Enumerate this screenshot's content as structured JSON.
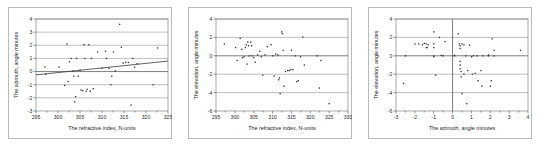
{
  "figure": {
    "panel_count": 3,
    "background_color": "#ffffff",
    "frame_color": "#b9b9b9",
    "marker_color": "#2b2b2b",
    "gridline_color": "#8a8a8a",
    "trendline_color": "#3a3a3a"
  },
  "chart_data": [
    {
      "type": "scatter",
      "title": "",
      "xlabel": "The refractive index, N-units",
      "ylabel": "The azimuth, angle minutes",
      "xlim": [
        295,
        325
      ],
      "ylim": [
        -3,
        4
      ],
      "xticks": [
        295,
        300,
        305,
        310,
        315,
        320,
        325
      ],
      "xtick_labels": [
        "295",
        "300",
        "305",
        "310",
        "315",
        "320",
        "325"
      ],
      "yticks": [
        -3,
        -2,
        -1,
        0,
        1,
        2,
        3,
        4
      ],
      "ytick_labels": [
        "-3",
        "-2",
        "-1",
        "0",
        "1",
        "2",
        "3",
        "4"
      ],
      "grid": true,
      "legend": null,
      "trendline": {
        "x0": 295,
        "y0": -0.25,
        "x1": 325,
        "y1": 0.8
      },
      "points": [
        [
          297.0,
          0.35
        ],
        [
          297.2,
          -0.2
        ],
        [
          300.2,
          0.35
        ],
        [
          301.5,
          -1.05
        ],
        [
          302.0,
          2.1
        ],
        [
          302.3,
          -0.75
        ],
        [
          302.6,
          0.75
        ],
        [
          303.0,
          1.0
        ],
        [
          303.4,
          0.05
        ],
        [
          303.6,
          -0.35
        ],
        [
          303.8,
          -2.3
        ],
        [
          304.0,
          -1.9
        ],
        [
          304.2,
          1.0
        ],
        [
          304.6,
          -0.35
        ],
        [
          305.0,
          0.1
        ],
        [
          305.2,
          -1.4
        ],
        [
          305.6,
          -1.45
        ],
        [
          305.9,
          2.05
        ],
        [
          306.1,
          1.0
        ],
        [
          306.4,
          -1.5
        ],
        [
          306.6,
          -1.35
        ],
        [
          307.0,
          2.05
        ],
        [
          307.3,
          -1.5
        ],
        [
          307.6,
          1.0
        ],
        [
          308.0,
          -1.3
        ],
        [
          309.0,
          1.5
        ],
        [
          310.0,
          0.25
        ],
        [
          310.8,
          1.55
        ],
        [
          311.0,
          1.0
        ],
        [
          311.6,
          0.25
        ],
        [
          312.0,
          -1.0
        ],
        [
          312.2,
          -0.35
        ],
        [
          312.6,
          1.5
        ],
        [
          313.0,
          0.05
        ],
        [
          314.0,
          3.6
        ],
        [
          314.4,
          1.85
        ],
        [
          314.8,
          0.65
        ],
        [
          315.4,
          0.7
        ],
        [
          316.0,
          0.7
        ],
        [
          316.6,
          -2.55
        ],
        [
          317.0,
          1.0
        ],
        [
          317.4,
          0.35
        ],
        [
          318.0,
          0.6
        ],
        [
          321.6,
          -1.0
        ],
        [
          322.6,
          1.8
        ]
      ]
    },
    {
      "type": "scatter",
      "title": "",
      "xlabel": "The refractive index, N-units",
      "ylabel": "The elevation, angle minutes",
      "xlim": [
        295,
        330
      ],
      "ylim": [
        -6,
        4
      ],
      "xticks": [
        295,
        300,
        305,
        310,
        315,
        320,
        325,
        330
      ],
      "xtick_labels": [
        "295",
        "300",
        "305",
        "310",
        "315",
        "320",
        "325",
        "330"
      ],
      "yticks": [
        -6,
        -4,
        -2,
        0,
        2,
        4
      ],
      "ytick_labels": [
        "-6",
        "-4",
        "-2",
        "0",
        "2",
        "4"
      ],
      "grid": true,
      "legend": null,
      "trendline": null,
      "points": [
        [
          297.2,
          1.3
        ],
        [
          300.2,
          0.9
        ],
        [
          300.6,
          -0.5
        ],
        [
          301.4,
          1.9
        ],
        [
          301.8,
          0.7
        ],
        [
          302.0,
          -0.2
        ],
        [
          302.4,
          -0.1
        ],
        [
          302.8,
          0.9
        ],
        [
          303.0,
          1.2
        ],
        [
          303.2,
          -0.9
        ],
        [
          303.4,
          1.5
        ],
        [
          303.6,
          1.1
        ],
        [
          303.8,
          0.0
        ],
        [
          304.2,
          1.5
        ],
        [
          304.4,
          1.1
        ],
        [
          304.6,
          0.0
        ],
        [
          305.0,
          -0.2
        ],
        [
          305.4,
          -0.7
        ],
        [
          306.0,
          0.1
        ],
        [
          306.6,
          0.5
        ],
        [
          307.0,
          -0.1
        ],
        [
          307.4,
          -2.1
        ],
        [
          308.0,
          0.1
        ],
        [
          308.6,
          1.0
        ],
        [
          309.6,
          1.2
        ],
        [
          310.0,
          0.0
        ],
        [
          310.4,
          -2.2
        ],
        [
          310.8,
          0.2
        ],
        [
          311.4,
          0.1
        ],
        [
          311.6,
          -2.6
        ],
        [
          311.8,
          -2.4
        ],
        [
          312.0,
          -4.1
        ],
        [
          312.4,
          2.6
        ],
        [
          312.6,
          2.4
        ],
        [
          312.8,
          0.6
        ],
        [
          313.0,
          -3.3
        ],
        [
          313.4,
          -1.7
        ],
        [
          314.0,
          -1.6
        ],
        [
          314.4,
          -1.6
        ],
        [
          314.8,
          -1.5
        ],
        [
          315.0,
          0.6
        ],
        [
          315.4,
          -1.5
        ],
        [
          316.0,
          0.0
        ],
        [
          316.4,
          -2.8
        ],
        [
          316.8,
          -2.7
        ],
        [
          317.4,
          -0.1
        ],
        [
          318.0,
          2.05
        ],
        [
          318.4,
          -1.0
        ],
        [
          321.8,
          0.0
        ],
        [
          322.4,
          -3.5
        ],
        [
          322.8,
          -0.5
        ],
        [
          325.0,
          -5.2
        ]
      ]
    },
    {
      "type": "scatter",
      "title": "",
      "xlabel": "The azimuth, angle minutes",
      "ylabel": "The elevation, angle minutes",
      "xlim": [
        -3,
        4
      ],
      "ylim": [
        -6,
        4
      ],
      "xticks": [
        -3,
        -2,
        -1,
        0,
        1,
        2,
        3,
        4
      ],
      "xtick_labels": [
        "-3",
        "-2",
        "-1",
        "0",
        "1",
        "2",
        "3",
        "4"
      ],
      "yticks": [
        -6,
        -4,
        -2,
        0,
        2,
        4
      ],
      "ytick_labels": [
        "-6",
        "-4",
        "-2",
        "0",
        "2",
        "4"
      ],
      "grid": true,
      "legend": null,
      "trendline": null,
      "points": [
        [
          -2.6,
          -3.0
        ],
        [
          -2.5,
          0.0
        ],
        [
          -2.0,
          1.3
        ],
        [
          -1.8,
          1.3
        ],
        [
          -1.6,
          1.2
        ],
        [
          -1.5,
          1.35
        ],
        [
          -1.4,
          1.3
        ],
        [
          -1.4,
          0.9
        ],
        [
          -1.35,
          0.9
        ],
        [
          -1.3,
          1.2
        ],
        [
          -1.0,
          2.6
        ],
        [
          -1.0,
          1.3
        ],
        [
          -1.0,
          0.9
        ],
        [
          -1.0,
          0.0
        ],
        [
          -1.0,
          -0.1
        ],
        [
          -0.9,
          -2.1
        ],
        [
          -0.7,
          2.0
        ],
        [
          -0.6,
          0.05
        ],
        [
          -0.5,
          0.0
        ],
        [
          -0.4,
          1.55
        ],
        [
          0.1,
          0.05
        ],
        [
          0.1,
          0.0
        ],
        [
          0.3,
          2.4
        ],
        [
          0.35,
          1.3
        ],
        [
          0.4,
          1.1
        ],
        [
          0.4,
          0.8
        ],
        [
          0.4,
          -0.6
        ],
        [
          0.4,
          -1.0
        ],
        [
          0.4,
          -1.4
        ],
        [
          0.45,
          -1.7
        ],
        [
          0.45,
          -2.3
        ],
        [
          0.5,
          -4.1
        ],
        [
          0.5,
          1.3
        ],
        [
          0.6,
          1.2
        ],
        [
          0.6,
          -2.0
        ],
        [
          0.7,
          0.0
        ],
        [
          0.75,
          -5.2
        ],
        [
          0.8,
          -1.6
        ],
        [
          0.9,
          1.15
        ],
        [
          1.0,
          -0.1
        ],
        [
          1.05,
          -2.0
        ],
        [
          1.1,
          0.0
        ],
        [
          1.2,
          -1.9
        ],
        [
          1.3,
          0.0
        ],
        [
          1.35,
          -2.7
        ],
        [
          1.5,
          -1.6
        ],
        [
          1.55,
          -3.3
        ],
        [
          1.6,
          0.0
        ],
        [
          1.9,
          0.1
        ],
        [
          1.9,
          0.0
        ],
        [
          2.0,
          -3.3
        ],
        [
          2.05,
          -2.7
        ],
        [
          2.1,
          1.85
        ],
        [
          2.2,
          0.6
        ],
        [
          2.2,
          0.0
        ],
        [
          3.6,
          0.6
        ]
      ]
    }
  ]
}
